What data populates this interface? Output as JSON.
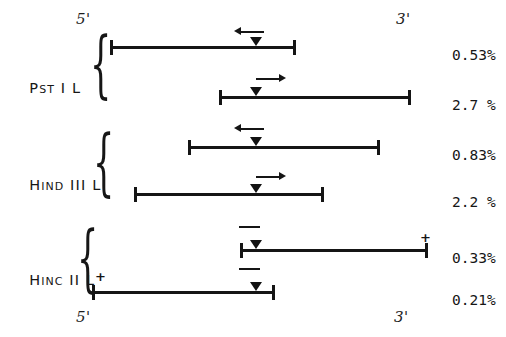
{
  "figure": {
    "top_axis": {
      "five_prime": "5'",
      "three_prime": "3'"
    },
    "bottom_axis": {
      "five_prime": "5'",
      "three_prime": "3'"
    }
  },
  "groups": [
    {
      "id": "pst-i-l",
      "label_main": "P",
      "label_small": "ST",
      "label_rest": " I L"
    },
    {
      "id": "hind-iii-l",
      "label_main": "H",
      "label_small": "IND",
      "label_rest": " III L"
    },
    {
      "id": "hinc-ii-l",
      "label_main": "H",
      "label_small": "INC",
      "label_rest": " II L"
    }
  ],
  "rows": [
    {
      "id": "row-1",
      "group": "pst-i-l",
      "marker": "arrow-left",
      "percent": "0.53%",
      "polarity": ""
    },
    {
      "id": "row-2",
      "group": "pst-i-l",
      "marker": "arrow-right",
      "percent": "2.7 %",
      "polarity": ""
    },
    {
      "id": "row-3",
      "group": "hind-iii-l",
      "marker": "arrow-left",
      "percent": "0.83%",
      "polarity": ""
    },
    {
      "id": "row-4",
      "group": "hind-iii-l",
      "marker": "arrow-right",
      "percent": "2.2 %",
      "polarity": ""
    },
    {
      "id": "row-5",
      "group": "hinc-ii-l",
      "marker": "dash",
      "percent": "0.33%",
      "polarity": "+"
    },
    {
      "id": "row-6",
      "group": "hinc-ii-l",
      "marker": "dash",
      "percent": "0.21%",
      "polarity": "+"
    }
  ],
  "colors": {
    "ink": "#151515",
    "background": "#ffffff"
  }
}
